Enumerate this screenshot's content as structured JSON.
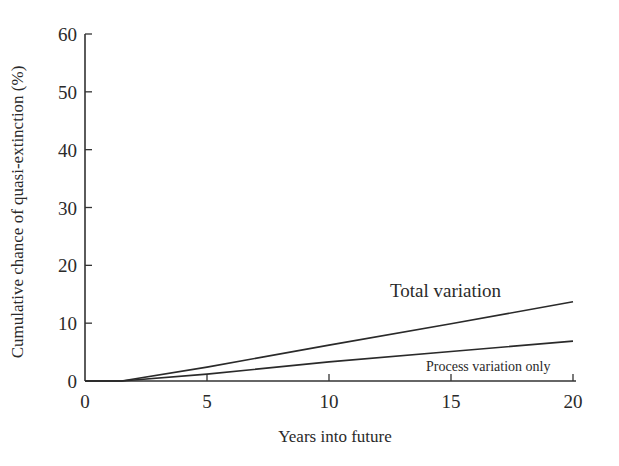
{
  "chart_data": {
    "type": "line",
    "title": "",
    "xlabel": "Years into future",
    "ylabel": "Cumulative chance of quasi-extinction (%)",
    "xlim": [
      0,
      20
    ],
    "ylim": [
      0,
      60
    ],
    "xticks": [
      0,
      5,
      10,
      15,
      20
    ],
    "yticks": [
      0,
      10,
      20,
      30,
      40,
      50,
      60
    ],
    "grid": false,
    "legend": "none (direct line annotations)",
    "x": [
      0,
      1.5,
      5,
      10,
      15,
      20
    ],
    "series": [
      {
        "name": "Total variation",
        "values": [
          0,
          0,
          2.4,
          6.2,
          9.9,
          13.7
        ]
      },
      {
        "name": "Process variation only",
        "values": [
          0,
          0,
          1.2,
          3.3,
          5.1,
          6.9
        ]
      }
    ],
    "annotations": [
      {
        "text": "Total variation",
        "near_x": 15,
        "near_y": 15.5
      },
      {
        "text": "Process variation only",
        "near_x": 16.5,
        "near_y": 1.2
      }
    ]
  },
  "labels": {
    "xlabel": "Years into future",
    "ylabel": "Cumulative chance of quasi-extinction (%)",
    "xticks": [
      "0",
      "5",
      "10",
      "15",
      "20"
    ],
    "yticks": [
      "0",
      "10",
      "20",
      "30",
      "40",
      "50",
      "60"
    ],
    "annot_total": "Total variation",
    "annot_process": "Process variation only"
  }
}
